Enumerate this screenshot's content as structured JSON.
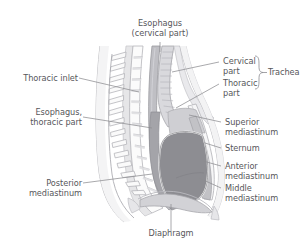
{
  "figure": {
    "type": "anatomical-diagram",
    "background_color": "#ffffff",
    "label_color": "#57575b",
    "leader_line_color": "#8c8c90"
  },
  "labels": {
    "esophagus_cervical": "Esophagus\n(cervical part)",
    "thoracic_inlet": "Thoracic inlet",
    "esophagus_thoracic": "Esophagus,\nthoracic part",
    "posterior_mediastinum": "Posterior\nmediastinum",
    "diaphragm": "Diaphragm",
    "cervical_part": "Cervical\npart",
    "thoracic_part": "Thoracic\npart",
    "trachea": "Trachea",
    "superior_mediastinum": "Superior\nmediastinum",
    "sternum": "Sternum",
    "anterior_mediastinum": "Anterior\nmediastinum",
    "middle_mediastinum": "Middle\nmediastinum"
  },
  "palette": {
    "bone_light": "#f2f2f2",
    "bone_edge": "#b9b9bd",
    "cartilage": "#dcdcdf",
    "soft_tissue": "#c9c9cd",
    "mediastinum_mid": "#8e8e93",
    "mediastinum_dark": "#808085",
    "heart": "#8a8a8f",
    "airway": "#d4d4d8",
    "outline": "#9a9a9e"
  }
}
